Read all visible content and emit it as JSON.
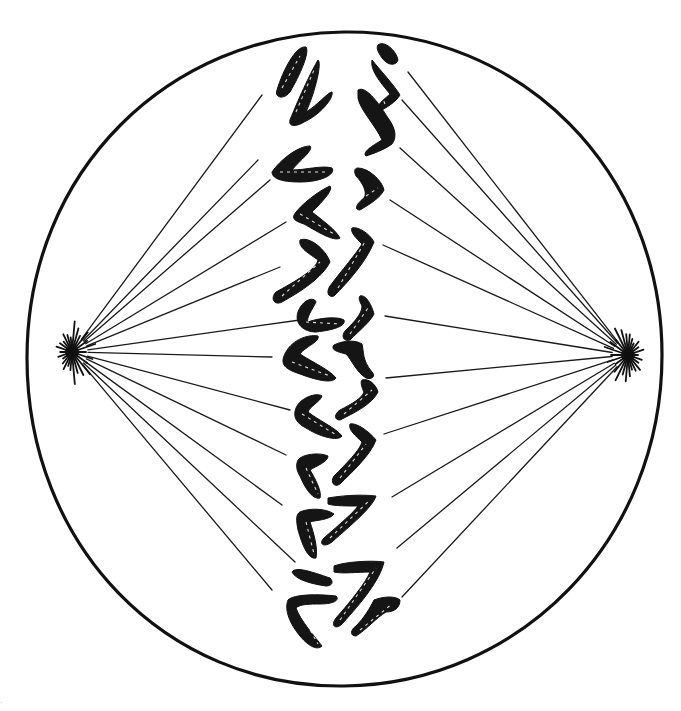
{
  "figure": {
    "background": "#ffffff",
    "ink": "#111111",
    "cell": {
      "cx": 344,
      "cy": 358,
      "rx": 318,
      "ry": 328
    },
    "poles": {
      "left": {
        "x": 72,
        "y": 352
      },
      "right": {
        "x": 628,
        "y": 355
      }
    },
    "fibers_left": [
      [
        262,
        95
      ],
      [
        258,
        160
      ],
      [
        270,
        180
      ],
      [
        286,
        222
      ],
      [
        280,
        267
      ],
      [
        300,
        320
      ],
      [
        272,
        357
      ],
      [
        290,
        410
      ],
      [
        286,
        455
      ],
      [
        282,
        505
      ],
      [
        295,
        562
      ],
      [
        272,
        590
      ]
    ],
    "fibers_right": [
      [
        408,
        72
      ],
      [
        402,
        100
      ],
      [
        400,
        148
      ],
      [
        390,
        200
      ],
      [
        383,
        245
      ],
      [
        385,
        316
      ],
      [
        386,
        378
      ],
      [
        384,
        434
      ],
      [
        392,
        497
      ],
      [
        397,
        548
      ],
      [
        402,
        597
      ]
    ],
    "chromosome_count_visible": 26,
    "corner_mark": "·"
  }
}
